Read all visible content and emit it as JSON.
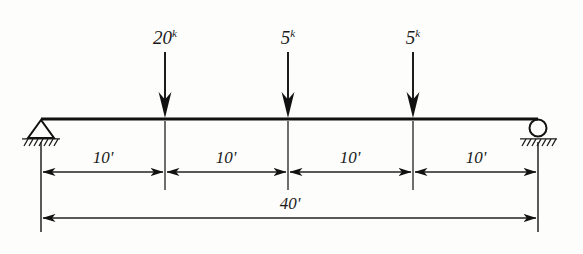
{
  "diagram": {
    "type": "beam-free-body-diagram",
    "units": {
      "force": "k",
      "length": "'"
    },
    "colors": {
      "ink": "#1a1a1a",
      "background": "#fdfdfb"
    },
    "beam": {
      "name": "beam-member",
      "span_label": "40'",
      "span_value": 40,
      "left_x": 41,
      "right_x": 538,
      "y": 119
    },
    "supports": [
      {
        "name": "pin-support",
        "kind": "pin",
        "label": "",
        "x": 41,
        "position_ft": 0
      },
      {
        "name": "roller-support",
        "kind": "roller",
        "label": "",
        "x": 538,
        "position_ft": 40
      }
    ],
    "loads": [
      {
        "name": "point-load-1",
        "magnitude": "20",
        "unit": "k",
        "label": "20",
        "sup": "k",
        "x": 165,
        "position_ft": 10
      },
      {
        "name": "point-load-2",
        "magnitude": "5",
        "unit": "k",
        "label": "5",
        "sup": "k",
        "x": 288,
        "position_ft": 20
      },
      {
        "name": "point-load-3",
        "magnitude": "5",
        "unit": "k",
        "label": "5",
        "sup": "k",
        "x": 413,
        "position_ft": 30
      }
    ],
    "segment_dimensions": [
      {
        "name": "dimension-segment-1",
        "label": "10'",
        "value": 10,
        "x1": 41,
        "x2": 165
      },
      {
        "name": "dimension-segment-2",
        "label": "10'",
        "value": 10,
        "x1": 165,
        "x2": 288
      },
      {
        "name": "dimension-segment-3",
        "label": "10'",
        "value": 10,
        "x1": 288,
        "x2": 413
      },
      {
        "name": "dimension-segment-4",
        "label": "10'",
        "value": 10,
        "x1": 413,
        "x2": 538
      }
    ],
    "overall_dimension": {
      "name": "overall-span-dimension",
      "label": "40'",
      "value": 40,
      "x1": 41,
      "x2": 538,
      "y": 218
    }
  }
}
